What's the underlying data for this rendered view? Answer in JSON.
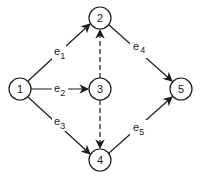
{
  "diagram": {
    "type": "directed-graph",
    "colors": {
      "stroke": "#1a1a1a",
      "background": "#ffffff"
    },
    "nodes": [
      {
        "id": "1",
        "label": "1",
        "x": 20,
        "y": 89
      },
      {
        "id": "2",
        "label": "2",
        "x": 100,
        "y": 18
      },
      {
        "id": "3",
        "label": "3",
        "x": 100,
        "y": 89
      },
      {
        "id": "4",
        "label": "4",
        "x": 100,
        "y": 160
      },
      {
        "id": "5",
        "label": "5",
        "x": 181,
        "y": 89
      }
    ],
    "edges": [
      {
        "from": "1",
        "to": "2",
        "label": "e",
        "sub": "1",
        "style": "solid"
      },
      {
        "from": "1",
        "to": "3",
        "label": "e",
        "sub": "2",
        "style": "solid"
      },
      {
        "from": "1",
        "to": "4",
        "label": "e",
        "sub": "3",
        "style": "solid"
      },
      {
        "from": "2",
        "to": "5",
        "label": "e",
        "sub": "4",
        "style": "solid"
      },
      {
        "from": "4",
        "to": "5",
        "label": "e",
        "sub": "5",
        "style": "solid"
      },
      {
        "from": "3",
        "to": "2",
        "label": "",
        "sub": "",
        "style": "dashed"
      },
      {
        "from": "3",
        "to": "4",
        "label": "",
        "sub": "",
        "style": "dashed"
      }
    ]
  }
}
